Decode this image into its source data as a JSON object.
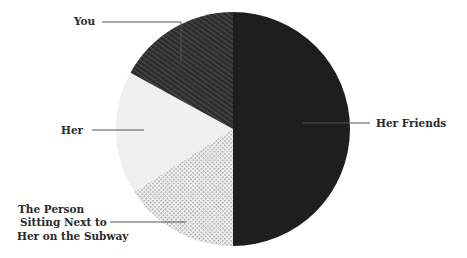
{
  "chart_data": {
    "type": "pie",
    "title": "",
    "start_angle_deg": 90,
    "direction": "clockwise",
    "slices": [
      {
        "label": "Her Friends",
        "value": 50,
        "color": "#1e1e1e",
        "pattern": "solid"
      },
      {
        "label": "The Person Sitting Next to Her on the Subway",
        "value": 16,
        "color": "#9a9a9a",
        "pattern": "dots"
      },
      {
        "label": "Her",
        "value": 17,
        "color": "#efefef",
        "pattern": "solid"
      },
      {
        "label": "You",
        "value": 17,
        "color": "#2e2e2e",
        "pattern": "diagonal-stripes"
      }
    ],
    "legend": "none (leader-line labels)"
  },
  "labels": {
    "you": "You",
    "her": "Her",
    "her_friends": "Her Friends",
    "subway_line1": "The Person",
    "subway_line2": "Sitting Next to",
    "subway_line3": "Her on the Subway"
  }
}
